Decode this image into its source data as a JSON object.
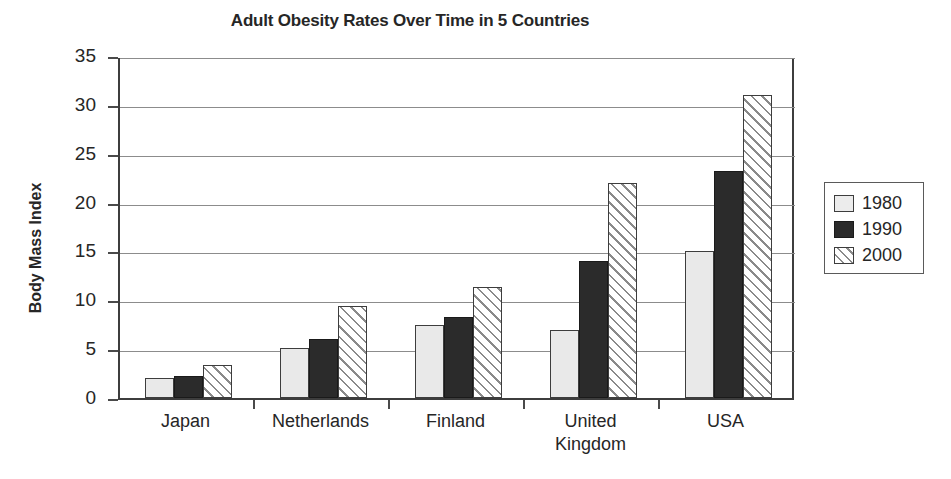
{
  "chart_data": {
    "type": "bar",
    "title": "Adult Obesity Rates Over Time in 5 Countries",
    "xlabel": "",
    "ylabel": "Body Mass Index",
    "ylim": [
      0,
      35
    ],
    "yticks": [
      0,
      5,
      10,
      15,
      20,
      25,
      30,
      35
    ],
    "ytick_labels": [
      "0",
      "5",
      "10",
      "15",
      "20",
      "25",
      "30",
      "35"
    ],
    "grid": true,
    "legend_position": "right",
    "categories": [
      "Japan",
      "Netherlands",
      "Finland",
      "United Kingdom",
      "USA"
    ],
    "category_label_lines": [
      [
        "Japan"
      ],
      [
        "Netherlands"
      ],
      [
        "Finland"
      ],
      [
        "United",
        "Kingdom"
      ],
      [
        "USA"
      ]
    ],
    "series": [
      {
        "name": "1980",
        "color": "#e9e9e9",
        "fill": "solid-light",
        "values": [
          2.0,
          5.1,
          7.5,
          7.0,
          15.0
        ]
      },
      {
        "name": "1990",
        "color": "#2b2b2b",
        "fill": "solid-dark",
        "values": [
          2.3,
          6.0,
          8.3,
          14.0,
          23.2
        ]
      },
      {
        "name": "2000",
        "color": "#ffffff",
        "fill": "diagonal-hatch",
        "values": [
          3.4,
          9.4,
          11.4,
          22.0,
          31.0
        ]
      }
    ]
  },
  "legend": {
    "items": [
      {
        "label": "1980",
        "swatch": "light-square-swatch"
      },
      {
        "label": "1990",
        "swatch": "dark-square-swatch"
      },
      {
        "label": "2000",
        "swatch": "hatched-square-swatch"
      }
    ]
  },
  "axis": {
    "y_title": "Body Mass Index",
    "y_tick_labels": [
      "35",
      "30",
      "25",
      "20",
      "15",
      "10",
      "5",
      "0"
    ]
  }
}
